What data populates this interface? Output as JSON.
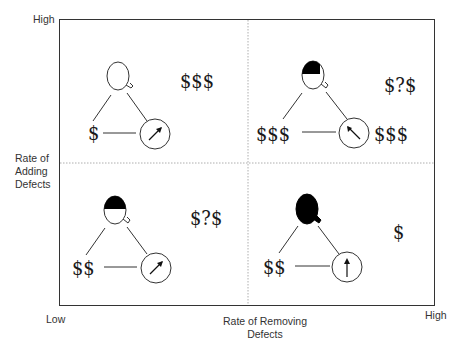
{
  "axes": {
    "y_high": "High",
    "y_label_line1": "Rate of",
    "y_label_line2": "Adding",
    "y_label_line3": "Defects",
    "x_low": "Low",
    "x_label_line1": "Rate of Removing",
    "x_label_line2": "Defects",
    "x_high": "High"
  },
  "quadrants": {
    "top_left": {
      "quality_fill": "empty",
      "cost_label": "$",
      "speed_arrow": "up-right",
      "outcome": "$$$"
    },
    "top_right": {
      "quality_fill": "half",
      "cost_label": "$$$",
      "speed_arrow": "up-left",
      "speed_cost": "$$$",
      "outcome": "$?$"
    },
    "bottom_left": {
      "quality_fill": "half",
      "cost_label": "$$",
      "speed_arrow": "up-right",
      "outcome": "$?$"
    },
    "bottom_right": {
      "quality_fill": "full",
      "cost_label": "$$",
      "speed_arrow": "up",
      "outcome": "$"
    }
  },
  "colors": {
    "line": "#333333",
    "fill": "#000000",
    "divider": "#999999"
  }
}
